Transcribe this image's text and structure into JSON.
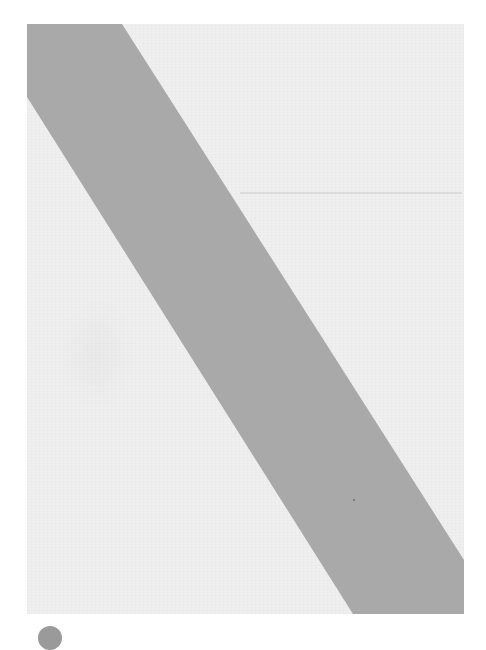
{
  "document": {
    "description": "Blank scanned page with diagonal gray band",
    "text_content": "",
    "colors": {
      "background": "#ffffff",
      "page": "#efefef",
      "band": "#a9a9a9",
      "fold_line": "#dcdcdc",
      "corner_mark": "#9a9a9a"
    },
    "band": {
      "points": "0,0 95,0 437,536 437,590 326,590 0,73"
    }
  }
}
